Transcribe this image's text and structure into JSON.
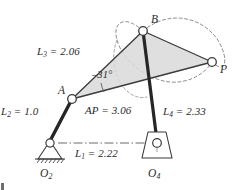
{
  "figure": {
    "type": "fourbar-linkage-diagram",
    "title": "",
    "colors": {
      "line": "#3a3a3a",
      "link_dark": "#2a2a2a",
      "coupler_fill": "#d8d8d8",
      "dashed_curve": "#7a7a7a",
      "ground_line": "#6a6a6a",
      "text": "#2b2b2b",
      "joint_fill": "#ffffff"
    },
    "labels": {
      "link3": {
        "text": "L",
        "sub": "3",
        "value": "= 2.06",
        "full": "L3 = 2.06"
      },
      "link2": {
        "text": "L",
        "sub": "2",
        "value": "= 1.0",
        "full": "L2 = 1.0"
      },
      "link4": {
        "text": "L",
        "sub": "4",
        "value": "= 2.33",
        "full": "L4 = 2.33"
      },
      "link1": {
        "text": "L",
        "sub": "1",
        "value": "= 2.22",
        "full": "L1 = 2.22"
      },
      "ap": {
        "text": "AP",
        "sub": "",
        "value": "= 3.06",
        "full": "AP = 3.06"
      },
      "angle": {
        "text": "–31°",
        "full": "-31 degrees"
      }
    },
    "points": {
      "A": {
        "label": "A",
        "sub": "",
        "x": 72,
        "y": 99
      },
      "B": {
        "label": "B",
        "sub": "",
        "x": 143,
        "y": 31
      },
      "P": {
        "label": "P",
        "sub": "",
        "x": 212,
        "y": 62
      },
      "O2": {
        "label": "O",
        "sub": "2",
        "x": 50,
        "y": 143
      },
      "O4": {
        "label": "O",
        "sub": "4",
        "x": 157,
        "y": 143
      }
    },
    "links": [
      {
        "name": "ground-link",
        "id": "L1",
        "from": "O2",
        "to": "O4",
        "length": "2.22"
      },
      {
        "name": "crank-link",
        "id": "L2",
        "from": "O2",
        "to": "A",
        "length": "1.0"
      },
      {
        "name": "coupler-link",
        "id": "L3",
        "from": "A",
        "to": "B",
        "length": "2.06"
      },
      {
        "name": "rocker-link",
        "id": "L4",
        "from": "O4",
        "to": "B",
        "length": "2.33"
      },
      {
        "name": "coupler-point-link",
        "id": "AP",
        "from": "A",
        "to": "P",
        "length": "3.06"
      }
    ]
  }
}
